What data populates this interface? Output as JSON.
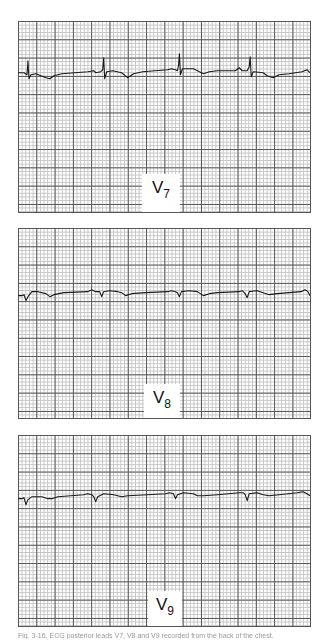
{
  "figure": {
    "panels": [
      {
        "id": "v7",
        "lead": "V",
        "lead_sub": "7",
        "trace_path": "M0,52 L6,52 L9,54 L10,40 L11,58 L13,54 L18,53 L28,57 L32,58 L36,55 L44,53 L70,51 L76,50 L78,52 L83,51 L85,49 L86,37 L87,58 L89,51 L95,50 L104,52 L110,57 L116,53 L125,51 L150,49 L154,48 L158,49 L160,50 L161,45 L162,33 L163,54 L165,48 L176,48 L180,50 L186,53 L192,51 L200,50 L218,50 L222,47 L225,50 L230,50 L232,46 L233,36 L234,56 L236,51 L246,52 L250,55 L256,57 L262,54 L272,53 L285,51 L290,49 L293,52"
      },
      {
        "id": "v8",
        "lead": "V",
        "lead_sub": "8",
        "trace_path": "M0,68 L4,68 L6,67 L8,73 L10,69 L14,64 L20,64 L28,66 L32,69 L36,67 L46,65 L70,64 L74,62 L78,64 L82,64 L84,69 L86,64 L92,63 L100,64 L104,65 L108,68 L114,66 L128,65 L150,64 L154,63 L158,64 L160,65 L162,69 L164,64 L172,63 L180,64 L186,68 L192,66 L200,65 L222,64 L225,63 L228,66 L230,70 L232,64 L240,63 L246,65 L252,67 L260,66 L272,65 L284,64 L288,62 L291,64 L293,68"
      },
      {
        "id": "v9",
        "lead": "V",
        "lead_sub": "9",
        "trace_path": "M0,64 L4,64 L6,63 L8,70 L10,65 L14,62 L24,62 L30,64 L34,64 L40,62 L66,60 L70,59 L74,60 L76,62 L78,67 L80,62 L86,59 L96,60 L100,61 L104,62 L110,61 L130,60 L148,59 L152,58 L156,59 L158,64 L160,60 L166,58 L176,59 L180,61 L186,61 L200,60 L222,58 L226,58 L228,60 L230,66 L232,59 L240,58 L246,60 L252,61 L262,60 L280,58 L286,57 L290,59 L293,61"
      }
    ],
    "caption": "Fig. 3-16. ECG posterior leads V7, V8 and V9 recorded from the back of the chest."
  },
  "colors": {
    "trace": "#1a1a1a",
    "grid_major": "#555555",
    "grid_minor": "#c4c4c4"
  }
}
